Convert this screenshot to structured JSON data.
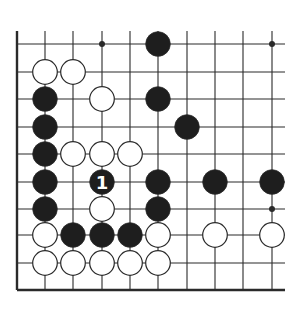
{
  "diagram": {
    "type": "go-board-fragment",
    "colors": {
      "background": "#ffffff",
      "line": "#2a2a2a",
      "black_stone": "#1e1e1e",
      "white_stone": "#ffffff",
      "stone_outline": "#2a2a2a",
      "label_on_black": "#ffffff"
    },
    "grid": {
      "columns_x": [
        17,
        45,
        73,
        102,
        130,
        158,
        187,
        215,
        243,
        272
      ],
      "rows_y": [
        44,
        72,
        99,
        127,
        154,
        182,
        209,
        235,
        263,
        290
      ],
      "top_extent": 31,
      "right_extent": 285,
      "left_edge_is_board_edge": true,
      "bottom_edge_is_board_edge": true
    },
    "star_points": [
      {
        "col": 3,
        "row": 0
      },
      {
        "col": 9,
        "row": 0
      },
      {
        "col": 9,
        "row": 6
      }
    ],
    "stones": [
      {
        "color": "black",
        "col": 5,
        "row": 0
      },
      {
        "color": "white",
        "col": 1,
        "row": 1
      },
      {
        "color": "white",
        "col": 2,
        "row": 1
      },
      {
        "color": "black",
        "col": 1,
        "row": 2
      },
      {
        "color": "white",
        "col": 3,
        "row": 2
      },
      {
        "color": "black",
        "col": 5,
        "row": 2
      },
      {
        "color": "black",
        "col": 1,
        "row": 3
      },
      {
        "color": "black",
        "col": 6,
        "row": 3
      },
      {
        "color": "black",
        "col": 1,
        "row": 4
      },
      {
        "color": "white",
        "col": 2,
        "row": 4
      },
      {
        "color": "white",
        "col": 3,
        "row": 4
      },
      {
        "color": "white",
        "col": 4,
        "row": 4
      },
      {
        "color": "black",
        "col": 1,
        "row": 5
      },
      {
        "color": "black",
        "col": 3,
        "row": 5,
        "label": "1"
      },
      {
        "color": "black",
        "col": 5,
        "row": 5
      },
      {
        "color": "black",
        "col": 7,
        "row": 5
      },
      {
        "color": "black",
        "col": 9,
        "row": 5
      },
      {
        "color": "black",
        "col": 1,
        "row": 6
      },
      {
        "color": "white",
        "col": 3,
        "row": 6
      },
      {
        "color": "black",
        "col": 5,
        "row": 6
      },
      {
        "color": "white",
        "col": 1,
        "row": 7
      },
      {
        "color": "black",
        "col": 2,
        "row": 7
      },
      {
        "color": "black",
        "col": 3,
        "row": 7
      },
      {
        "color": "black",
        "col": 4,
        "row": 7
      },
      {
        "color": "white",
        "col": 5,
        "row": 7
      },
      {
        "color": "white",
        "col": 7,
        "row": 7
      },
      {
        "color": "white",
        "col": 9,
        "row": 7
      },
      {
        "color": "white",
        "col": 1,
        "row": 8
      },
      {
        "color": "white",
        "col": 2,
        "row": 8
      },
      {
        "color": "white",
        "col": 3,
        "row": 8
      },
      {
        "color": "white",
        "col": 4,
        "row": 8
      },
      {
        "color": "white",
        "col": 5,
        "row": 8
      }
    ],
    "move_labels": [
      {
        "text": "1",
        "col": 3,
        "row": 5
      }
    ]
  }
}
